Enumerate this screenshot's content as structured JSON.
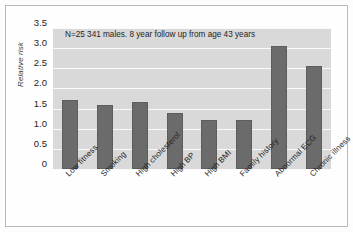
{
  "chart_data": {
    "type": "bar",
    "title": "",
    "annotation": "N=25 341 males. 8 year follow up from age 43 years",
    "xlabel": "",
    "ylabel": "Relative risk",
    "ylim": [
      0,
      3.5
    ],
    "yticks": [
      "0",
      "0.5",
      "1.0",
      "1.5",
      "2.0",
      "2.5",
      "3.0",
      "3.5"
    ],
    "ytick_values": [
      0,
      0.5,
      1.0,
      1.5,
      2.0,
      2.5,
      3.0,
      3.5
    ],
    "grid": true,
    "legend": "none",
    "categories": [
      "Low fitness",
      "Smoking",
      "High cholesterol",
      "High BP",
      "High BMI",
      "Family history",
      "Abnormal ECG",
      "Chronic illness"
    ],
    "values": [
      1.72,
      1.58,
      1.66,
      1.38,
      1.22,
      1.22,
      3.05,
      2.55
    ],
    "bar_color": "#6b6b6b",
    "plot_background": "#d9d9d9",
    "gridline_color": "#fafafa",
    "frame_color": "#b9b9b9"
  }
}
